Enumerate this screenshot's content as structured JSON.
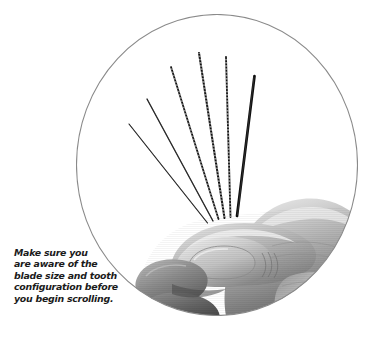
{
  "figure": {
    "kind": "photograph",
    "color_mode": "grayscale",
    "background_color": "#ffffff",
    "frame": {
      "shape": "circle",
      "stroke_color": "#8a8a8a",
      "stroke_width": 1,
      "fill_color": "#ffffff",
      "center_x": 217,
      "center_y": 165,
      "radius": 140
    }
  },
  "caption": {
    "text": "Make sure you are aware of the blade size and tooth configuration before you begin scrolling.",
    "color": "#1b1b1b",
    "style": "bold-italic",
    "lines": [
      "Make sure you",
      "are aware of the",
      "blade size and tooth",
      "configuration before",
      "you begin scrolling."
    ]
  },
  "photo": {
    "blade_count": 6,
    "blade_color": "#141414",
    "blade_highlight_color": "#4a4a4a",
    "blades": [
      {
        "name": "blade-1",
        "tip_x": 53,
        "tip_y": 110,
        "base_x": 131,
        "base_y": 208,
        "width": 1.1,
        "toothed": false
      },
      {
        "name": "blade-2",
        "tip_x": 71,
        "tip_y": 85,
        "base_x": 137,
        "base_y": 206,
        "width": 1.3,
        "toothed": false
      },
      {
        "name": "blade-3",
        "tip_x": 95,
        "tip_y": 53,
        "base_x": 142,
        "base_y": 204,
        "width": 1.7,
        "toothed": true
      },
      {
        "name": "blade-4",
        "tip_x": 123,
        "tip_y": 39,
        "base_x": 148,
        "base_y": 203,
        "width": 2.0,
        "toothed": true
      },
      {
        "name": "blade-5",
        "tip_x": 150,
        "tip_y": 43,
        "base_x": 154,
        "base_y": 202,
        "width": 1.8,
        "toothed": true
      },
      {
        "name": "blade-6",
        "tip_x": 178,
        "tip_y": 62,
        "base_x": 160,
        "base_y": 201,
        "width": 2.6,
        "toothed": false
      }
    ],
    "hand": {
      "skin_light": "#e3e3e3",
      "skin_mid": "#b4b4b4",
      "skin_shade": "#8f8f8f",
      "skin_dark": "#6a6a6a",
      "skin_deep": "#3f3f3f",
      "thumbnail_color": "#c9c9c9"
    }
  }
}
